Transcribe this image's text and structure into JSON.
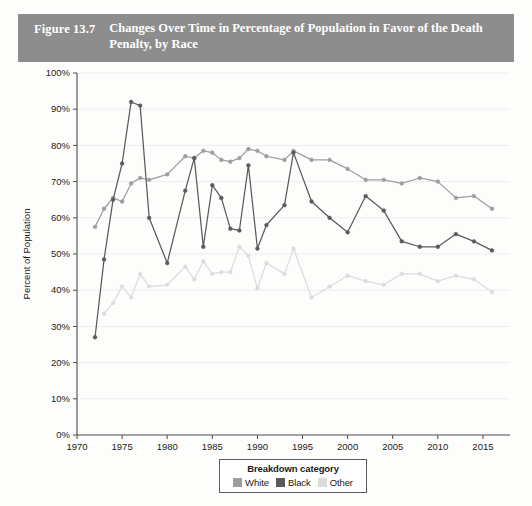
{
  "figure": {
    "number": "Figure 13.7",
    "title": "Changes Over Time in Percentage of Population in Favor of the Death Penalty, by Race",
    "header_color": "#8d8d8d"
  },
  "legend": {
    "title": "Breakdown category",
    "position": "bottom-center",
    "items": [
      {
        "label": "White",
        "color": "#9e9e9e"
      },
      {
        "label": "Black",
        "color": "#5a5a5a"
      },
      {
        "label": "Other",
        "color": "#dcdcdc"
      }
    ]
  },
  "chart_data": {
    "type": "line",
    "title": "Changes Over Time in Percentage of Population in Favor of the Death Penalty, by Race",
    "xlabel": "",
    "ylabel": "Percent of Population",
    "xlim": [
      1970,
      2018
    ],
    "ylim": [
      0,
      100
    ],
    "grid": true,
    "y_tick_labels": [
      "0%",
      "10%",
      "20%",
      "30%",
      "40%",
      "50%",
      "60%",
      "70%",
      "80%",
      "90%",
      "100%"
    ],
    "y_ticks": [
      0,
      10,
      20,
      30,
      40,
      50,
      60,
      70,
      80,
      90,
      100
    ],
    "x_tick_labels": [
      "1970",
      "1975",
      "1980",
      "1985",
      "1990",
      "1995",
      "2000",
      "2005",
      "2010",
      "2015"
    ],
    "x_ticks": [
      1970,
      1975,
      1980,
      1985,
      1990,
      1995,
      2000,
      2005,
      2010,
      2015
    ],
    "series": [
      {
        "name": "White",
        "color": "#9e9e9e",
        "x": [
          1972,
          1973,
          1974,
          1975,
          1976,
          1977,
          1978,
          1980,
          1982,
          1983,
          1984,
          1985,
          1986,
          1987,
          1988,
          1989,
          1990,
          1991,
          1993,
          1994,
          1996,
          1998,
          2000,
          2002,
          2004,
          2006,
          2008,
          2010,
          2012,
          2014,
          2016
        ],
        "values": [
          57.5,
          62.5,
          65.5,
          64.5,
          69.5,
          71.0,
          70.5,
          72.0,
          77.0,
          76.5,
          78.5,
          78.0,
          76.0,
          75.5,
          76.5,
          79.0,
          78.5,
          77.0,
          76.0,
          78.5,
          76.0,
          76.0,
          73.5,
          70.5,
          70.5,
          69.5,
          71.0,
          70.0,
          65.5,
          66.0,
          62.5
        ]
      },
      {
        "name": "Black",
        "color": "#5a5a5a",
        "x": [
          1972,
          1973,
          1974,
          1975,
          1976,
          1977,
          1978,
          1980,
          1982,
          1983,
          1984,
          1985,
          1986,
          1987,
          1988,
          1989,
          1990,
          1991,
          1993,
          1994,
          1996,
          1998,
          2000,
          2002,
          2004,
          2006,
          2008,
          2010,
          2012,
          2014,
          2016
        ],
        "values": [
          27.0,
          48.5,
          65.0,
          75.0,
          92.0,
          91.0,
          60.0,
          47.5,
          67.5,
          76.5,
          52.0,
          69.0,
          65.5,
          57.0,
          56.5,
          74.5,
          51.5,
          58.0,
          63.5,
          78.0,
          64.5,
          60.0,
          56.0,
          66.0,
          62.0,
          53.5,
          52.0,
          52.0,
          55.5,
          53.5,
          51.0
        ]
      },
      {
        "name": "Other",
        "color": "#dcdcdc",
        "x": [
          1973,
          1974,
          1975,
          1976,
          1977,
          1978,
          1980,
          1982,
          1983,
          1984,
          1985,
          1986,
          1987,
          1988,
          1989,
          1990,
          1991,
          1993,
          1994,
          1996,
          1998,
          2000,
          2002,
          2004,
          2006,
          2008,
          2010,
          2012,
          2014,
          2016
        ],
        "values": [
          33.5,
          36.5,
          41.0,
          38.0,
          44.5,
          41.0,
          41.5,
          46.5,
          43.0,
          48.0,
          44.5,
          45.0,
          45.0,
          52.0,
          49.5,
          40.5,
          47.5,
          44.5,
          51.5,
          38.0,
          41.0,
          44.0,
          42.5,
          41.5,
          44.5,
          44.5,
          42.5,
          44.0,
          43.0,
          39.5
        ]
      }
    ]
  }
}
